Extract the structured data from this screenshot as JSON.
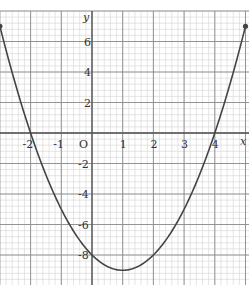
{
  "chart_data": {
    "type": "line",
    "title": "",
    "xlabel": "x",
    "ylabel": "y",
    "origin_label": "O",
    "function": "y = x^2 - 2x - 8",
    "x_ticks": [
      -2,
      -1,
      1,
      2,
      3,
      4
    ],
    "x_tick_labels": [
      "-2",
      "-1",
      "1",
      "2",
      "3",
      "4"
    ],
    "y_ticks": [
      6,
      4,
      2,
      -2,
      -4,
      -6,
      -8
    ],
    "y_tick_labels": [
      "6",
      "4",
      "2",
      "-2",
      "-4",
      "-6",
      "-8"
    ],
    "xlim": [
      -3,
      5
    ],
    "ylim": [
      -10,
      8
    ],
    "grid": true,
    "legend": null,
    "series": [
      {
        "name": "curve",
        "x": [
          -3,
          -2.5,
          -2,
          -1.5,
          -1,
          -0.5,
          0,
          0.5,
          1,
          1.5,
          2,
          2.5,
          3,
          3.5,
          4,
          4.5,
          5
        ],
        "y": [
          7,
          3.25,
          0,
          -2.75,
          -5,
          -6.75,
          -8,
          -8.75,
          -9,
          -8.75,
          -8,
          -6.75,
          -5,
          -2.75,
          0,
          3.25,
          7
        ]
      }
    ],
    "endpoints": [
      [
        -3,
        7
      ],
      [
        5,
        7
      ]
    ],
    "x_intercepts": [
      -2,
      4
    ],
    "y_intercept": -8,
    "minimum": [
      1,
      -9
    ]
  },
  "colors": {
    "curve": "#444444",
    "major_grid": "#8a8a8a",
    "minor_grid": "#d4d4d4",
    "axes": "#555555",
    "background": "#ffffff"
  }
}
